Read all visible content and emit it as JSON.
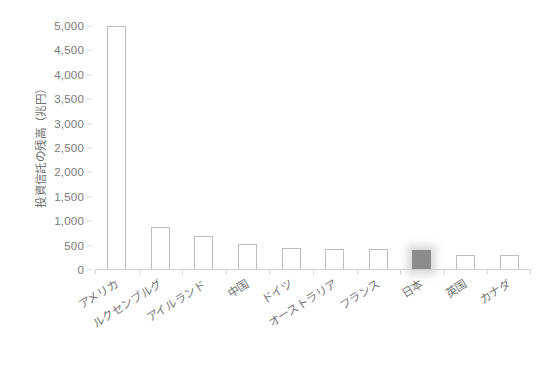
{
  "chart_data": {
    "type": "bar",
    "title": "",
    "subtitle": "",
    "xlabel": "",
    "ylabel": "投資信託の残高（兆円）",
    "ylim": [
      0,
      5000
    ],
    "ytick_step": 500,
    "yticks": [
      "5,000",
      "4,500",
      "4,000",
      "3,500",
      "3,000",
      "2,500",
      "2,000",
      "1,500",
      "1,000",
      "500",
      "0"
    ],
    "ytick_values": [
      5000,
      4500,
      4000,
      3500,
      3000,
      2500,
      2000,
      1500,
      1000,
      500,
      0
    ],
    "grid": false,
    "legend": null,
    "categories": [
      "アメリカ",
      "ルクセンブルグ",
      "アイルランド",
      "中国",
      "ドイツ",
      "オーストラリア",
      "フランス",
      "日本",
      "英国",
      "カナダ"
    ],
    "values": [
      5000,
      890,
      700,
      540,
      455,
      440,
      435,
      410,
      310,
      305
    ],
    "highlight_index": 7,
    "highlight_category": "日本",
    "bar_style": {
      "fill": "#ffffff",
      "border": "#bdbdbd",
      "highlight_fill": "#8c8c8c"
    },
    "axis_color": "#cfcfcf",
    "text_color": "#757575"
  }
}
